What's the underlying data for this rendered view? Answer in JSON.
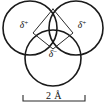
{
  "figure": {
    "name": "water-molecule-partial-charges",
    "background_color": "#ffffff",
    "line_color": "#1a1a1a",
    "bond_color": "#2b2b2b",
    "text_color": "#111111"
  },
  "atoms": [
    {
      "id": "hydrogen-left",
      "label_symbol": "δ",
      "label_sign": "+",
      "cx": 30,
      "cy": 28,
      "r": 27
    },
    {
      "id": "hydrogen-right",
      "label_symbol": "δ",
      "label_sign": "+",
      "cx": 76,
      "cy": 28,
      "r": 27
    },
    {
      "id": "oxygen-bottom",
      "label_symbol": "δ",
      "label_sign": "−",
      "cx": 53,
      "cy": 58,
      "r": 28
    }
  ],
  "charge_labels": [
    {
      "id": "delta-plus-left",
      "symbol": "δ",
      "sign": "+",
      "x": 24,
      "y": 28
    },
    {
      "id": "delta-plus-right",
      "symbol": "δ",
      "sign": "+",
      "x": 82,
      "y": 28
    },
    {
      "id": "delta-minus-bottom",
      "symbol": "δ",
      "sign": "−",
      "x": 53,
      "y": 57
    }
  ],
  "bond_outline": {
    "id": "charge-rhombus",
    "points": "53,9 33,33 53,49 73,33 53,9"
  },
  "scale_bar": {
    "label": "2 Å",
    "value": 2,
    "unit": "Å",
    "x_start": 23,
    "x_end": 85,
    "y": 101,
    "tick_height": 6,
    "label_x": 54,
    "label_y": 96
  }
}
